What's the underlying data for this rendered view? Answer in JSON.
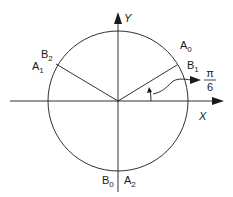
{
  "diagram": {
    "type": "unit-circle-phase-diagram",
    "axes": {
      "x_label": "X",
      "y_label": "Y"
    },
    "angle": {
      "numerator": "π",
      "denominator": "6",
      "degrees": 30
    },
    "points": [
      {
        "id": "A0",
        "letter": "A",
        "sub": "0",
        "position": "upper-right"
      },
      {
        "id": "B1",
        "letter": "B",
        "sub": "1",
        "position": "upper-right"
      },
      {
        "id": "B2",
        "letter": "B",
        "sub": "2",
        "position": "upper-left"
      },
      {
        "id": "A1",
        "letter": "A",
        "sub": "1",
        "position": "upper-left"
      },
      {
        "id": "B0",
        "letter": "B",
        "sub": "0",
        "position": "bottom"
      },
      {
        "id": "A2",
        "letter": "A",
        "sub": "2",
        "position": "bottom"
      }
    ],
    "colors": {
      "stroke": "#1a1a1a",
      "background": "#ffffff"
    }
  }
}
